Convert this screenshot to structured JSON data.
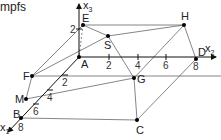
{
  "caption": "mpfs",
  "axes": {
    "x1": {
      "label": "x",
      "sub": "1",
      "ticks": [
        "2",
        "4",
        "6",
        "8"
      ]
    },
    "x2": {
      "label": "x",
      "sub": "2",
      "ticks": [
        "2",
        "4",
        "6",
        "8"
      ]
    },
    "x3": {
      "label": "x",
      "sub": "3",
      "ticks": [
        "2"
      ]
    }
  },
  "points": {
    "A": "A",
    "B": "B",
    "C": "C",
    "D": "D",
    "E": "E",
    "F": "F",
    "G": "G",
    "H": "H",
    "M": "M",
    "S": "S"
  },
  "colors": {
    "line": "#555555",
    "axis": "#111111",
    "point": "#000000"
  }
}
